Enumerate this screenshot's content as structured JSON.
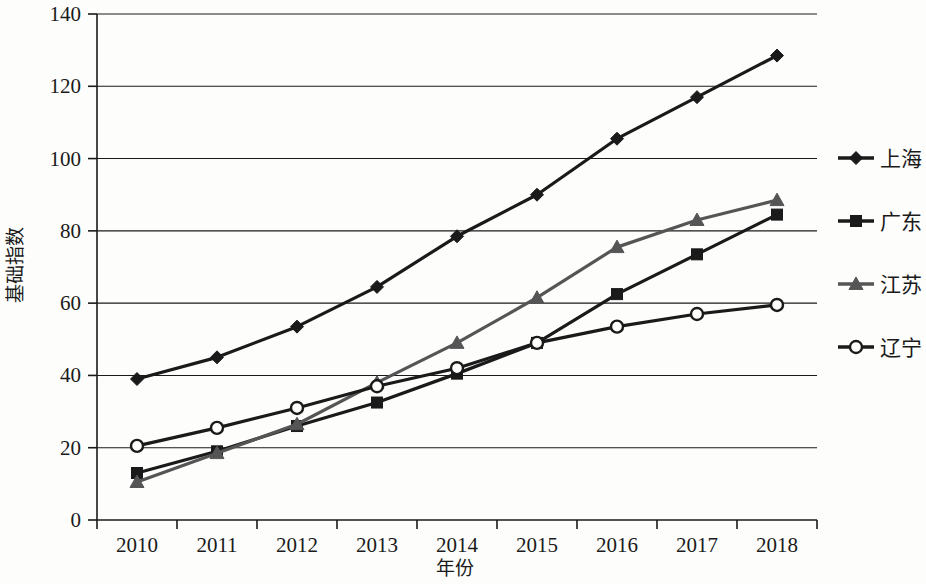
{
  "chart_data": {
    "type": "line",
    "title": "",
    "xlabel": "年份",
    "ylabel": "基础指数",
    "categories": [
      "2010",
      "2011",
      "2012",
      "2013",
      "2014",
      "2015",
      "2016",
      "2017",
      "2018"
    ],
    "x": [
      2010,
      2011,
      2012,
      2013,
      2014,
      2015,
      2016,
      2017,
      2018
    ],
    "ylim": [
      0,
      140
    ],
    "yticks": [
      0,
      20,
      40,
      60,
      80,
      100,
      120,
      140
    ],
    "ytick_labels": [
      "0",
      "20",
      "40",
      "60",
      "80",
      "100",
      "120",
      "140"
    ],
    "grid": "horizontal",
    "legend_position": "right",
    "series": [
      {
        "name": "上海",
        "marker": "diamond",
        "color": "#1a1a1a",
        "values": [
          39,
          45,
          53.5,
          64.5,
          78.5,
          90,
          105.5,
          117,
          128.5
        ]
      },
      {
        "name": "广东",
        "marker": "square",
        "color": "#1a1a1a",
        "values": [
          13,
          19,
          26,
          32.5,
          40.5,
          49,
          62.5,
          73.5,
          84.5
        ]
      },
      {
        "name": "江苏",
        "marker": "triangle",
        "color": "#555555",
        "values": [
          10.5,
          18.5,
          26.5,
          38,
          49,
          61.5,
          75.5,
          83,
          88.5
        ]
      },
      {
        "name": "辽宁",
        "marker": "circle-open",
        "color": "#1a1a1a",
        "values": [
          20.5,
          25.5,
          31,
          37,
          42,
          49,
          53.5,
          57,
          59.5
        ]
      }
    ]
  },
  "axes": {
    "x_title": "年份",
    "y_title": "基础指数"
  },
  "legend": {
    "items": [
      {
        "label": "上海",
        "marker": "diamond",
        "color": "#1a1a1a"
      },
      {
        "label": "广东",
        "marker": "square",
        "color": "#1a1a1a"
      },
      {
        "label": "江苏",
        "marker": "triangle",
        "color": "#555555"
      },
      {
        "label": "辽宁",
        "marker": "circle-open",
        "color": "#1a1a1a"
      }
    ]
  }
}
